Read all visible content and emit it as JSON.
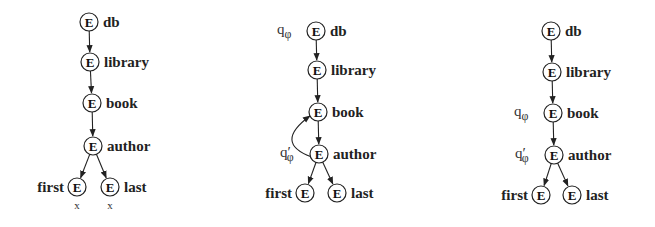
{
  "diagram": {
    "node_symbol": "E",
    "trees": [
      {
        "id": "tree-1",
        "nodes": [
          {
            "id": "db",
            "label": "db",
            "x": 89,
            "y": 22,
            "label_side": "right"
          },
          {
            "id": "library",
            "label": "library",
            "x": 90,
            "y": 62,
            "label_side": "right"
          },
          {
            "id": "book",
            "label": "book",
            "x": 92,
            "y": 103,
            "label_side": "right"
          },
          {
            "id": "author",
            "label": "author",
            "x": 93,
            "y": 146,
            "label_side": "right"
          },
          {
            "id": "first",
            "label": "first",
            "x": 77,
            "y": 187,
            "label_side": "left",
            "mark": "x"
          },
          {
            "id": "last",
            "label": "last",
            "x": 110,
            "y": 187,
            "label_side": "right",
            "mark": "x"
          }
        ],
        "edges": [
          [
            "db",
            "library"
          ],
          [
            "library",
            "book"
          ],
          [
            "book",
            "author"
          ],
          [
            "author",
            "first"
          ],
          [
            "author",
            "last"
          ]
        ],
        "states": []
      },
      {
        "id": "tree-2",
        "nodes": [
          {
            "id": "db",
            "label": "db",
            "x": 316,
            "y": 31,
            "label_side": "right"
          },
          {
            "id": "library",
            "label": "library",
            "x": 317,
            "y": 70,
            "label_side": "right"
          },
          {
            "id": "book",
            "label": "book",
            "x": 318,
            "y": 112,
            "label_side": "right"
          },
          {
            "id": "author",
            "label": "author",
            "x": 319,
            "y": 154,
            "label_side": "right"
          },
          {
            "id": "first",
            "label": "first",
            "x": 305,
            "y": 193,
            "label_side": "left"
          },
          {
            "id": "last",
            "label": "last",
            "x": 337,
            "y": 193,
            "label_side": "right"
          }
        ],
        "edges": [
          [
            "db",
            "library"
          ],
          [
            "library",
            "book"
          ],
          [
            "book",
            "author"
          ],
          [
            "author",
            "first"
          ],
          [
            "author",
            "last"
          ]
        ],
        "back_edges": [
          [
            "author",
            "book"
          ]
        ],
        "states": [
          {
            "text": "q",
            "sub": "φ",
            "prime": false,
            "node": "db"
          },
          {
            "text": "q",
            "sub": "φ",
            "prime": true,
            "node": "author"
          }
        ]
      },
      {
        "id": "tree-3",
        "nodes": [
          {
            "id": "db",
            "label": "db",
            "x": 551,
            "y": 31,
            "label_side": "right"
          },
          {
            "id": "library",
            "label": "library",
            "x": 552,
            "y": 72,
            "label_side": "right"
          },
          {
            "id": "book",
            "label": "book",
            "x": 553,
            "y": 113,
            "label_side": "right"
          },
          {
            "id": "author",
            "label": "author",
            "x": 554,
            "y": 155,
            "label_side": "right"
          },
          {
            "id": "first",
            "label": "first",
            "x": 541,
            "y": 195,
            "label_side": "left"
          },
          {
            "id": "last",
            "label": "last",
            "x": 572,
            "y": 195,
            "label_side": "right"
          }
        ],
        "edges": [
          [
            "db",
            "library"
          ],
          [
            "library",
            "book"
          ],
          [
            "book",
            "author"
          ],
          [
            "author",
            "first"
          ],
          [
            "author",
            "last"
          ]
        ],
        "states": [
          {
            "text": "q",
            "sub": "φ",
            "prime": false,
            "node": "book"
          },
          {
            "text": "q",
            "sub": "φ",
            "prime": true,
            "node": "author"
          }
        ]
      }
    ]
  }
}
